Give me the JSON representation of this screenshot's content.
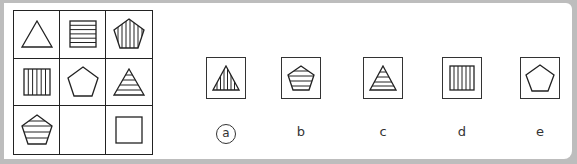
{
  "puzzle": {
    "type": "3x3 matrix reasoning",
    "grid": [
      [
        {
          "shape": "triangle",
          "fill": "empty"
        },
        {
          "shape": "square",
          "fill": "horizontal-lines"
        },
        {
          "shape": "pentagon",
          "fill": "vertical-lines"
        }
      ],
      [
        {
          "shape": "square",
          "fill": "vertical-lines"
        },
        {
          "shape": "pentagon",
          "fill": "empty"
        },
        {
          "shape": "triangle",
          "fill": "horizontal-lines"
        }
      ],
      [
        {
          "shape": "pentagon",
          "fill": "horizontal-lines"
        },
        {
          "shape": "missing",
          "fill": "blank"
        },
        {
          "shape": "square",
          "fill": "empty"
        }
      ]
    ],
    "options": [
      {
        "label": "a",
        "shape": "triangle",
        "fill": "vertical-lines",
        "selected": true
      },
      {
        "label": "b",
        "shape": "pentagon",
        "fill": "horizontal-lines",
        "selected": false
      },
      {
        "label": "c",
        "shape": "triangle",
        "fill": "horizontal-lines",
        "selected": false
      },
      {
        "label": "d",
        "shape": "square",
        "fill": "vertical-lines",
        "selected": false
      },
      {
        "label": "e",
        "shape": "pentagon",
        "fill": "empty",
        "selected": false
      }
    ]
  }
}
